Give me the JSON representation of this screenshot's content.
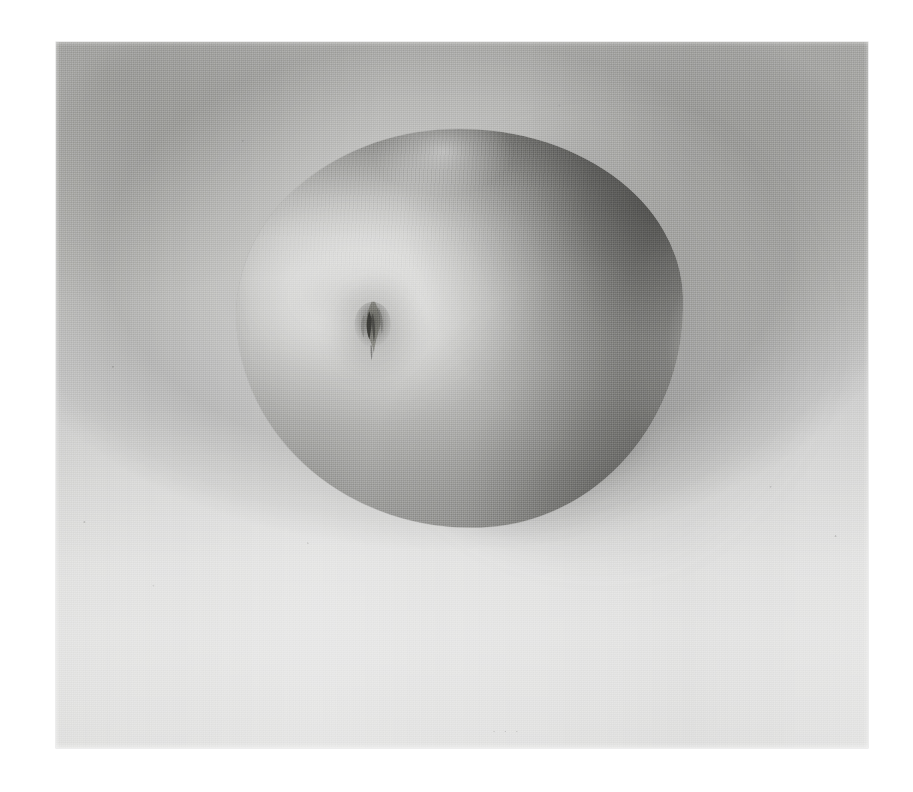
{
  "artwork": {
    "medium_description": "grayscale still-life painting on woven canvas",
    "subject": "apple",
    "inscription_text": "·  ·  ·",
    "canvas": {
      "left_px": 56,
      "top_px": 42,
      "width_px": 812,
      "height_px": 706
    },
    "page": {
      "width_px": 913,
      "height_px": 792,
      "background_color": "#ffffff"
    }
  },
  "palette": {
    "page_background": "#ffffff",
    "canvas_base": "#c9c9c7",
    "ground_top": "#b9b9b7",
    "ground_bottom": "#dadad9",
    "background_shadow": "#a0a0a0",
    "fruit_midtone": "#bcbcba",
    "fruit_highlight": "#d9d9d7",
    "fruit_core_shadow": "#6e6e6c",
    "cast_shadow": "#585856",
    "calyx_dark": "#3c3c3a",
    "inscription_color": "#767674"
  },
  "elements": {
    "fruit_label": "apple",
    "calyx_label": "blossom end",
    "cast_shadow_label": "cast shadow",
    "background_label": "canvas ground",
    "inscription_label": "faint inscription"
  }
}
